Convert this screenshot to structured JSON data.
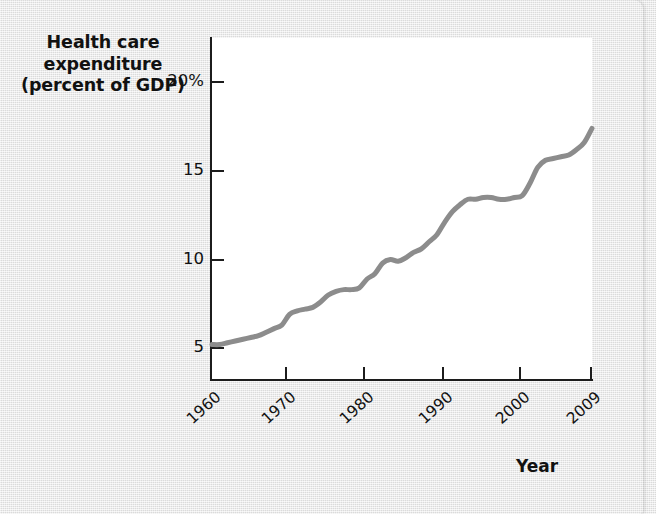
{
  "figure": {
    "background_color": "#e8e8e8",
    "plot_background_color": "#ffffff",
    "axis_color": "#1c1c1c"
  },
  "chart_data": {
    "type": "line",
    "title": "",
    "ylabel": "Health care expenditure (percent of GDP)",
    "ylabel_lines": [
      "Health care",
      "expenditure",
      "(percent of GDP)"
    ],
    "xlabel": "Year",
    "xlim": [
      1960,
      2009
    ],
    "ylim": [
      3.2,
      22.5
    ],
    "grid": false,
    "legend": null,
    "line_color": "#8c8c8c",
    "line_width": 5,
    "yticks": [
      20,
      15,
      10,
      5
    ],
    "ytick_labels": [
      "20%",
      "15",
      "10",
      "5"
    ],
    "xticks": [
      1960,
      1970,
      1980,
      1990,
      2000,
      2009
    ],
    "xtick_labels": [
      "1960",
      "1970",
      "1980",
      "1990",
      "2000",
      "2009"
    ],
    "series": [
      {
        "name": "Health care expenditure (percent of GDP)",
        "x": [
          1960,
          1961,
          1962,
          1963,
          1964,
          1965,
          1966,
          1967,
          1968,
          1969,
          1970,
          1971,
          1972,
          1973,
          1974,
          1975,
          1976,
          1977,
          1978,
          1979,
          1980,
          1981,
          1982,
          1983,
          1984,
          1985,
          1986,
          1987,
          1988,
          1989,
          1990,
          1991,
          1992,
          1993,
          1994,
          1995,
          1996,
          1997,
          1998,
          1999,
          2000,
          2001,
          2002,
          2003,
          2004,
          2005,
          2006,
          2007,
          2008,
          2009
        ],
        "values": [
          5.2,
          5.2,
          5.3,
          5.4,
          5.5,
          5.6,
          5.7,
          5.9,
          6.1,
          6.3,
          6.9,
          7.1,
          7.2,
          7.3,
          7.6,
          8.0,
          8.2,
          8.3,
          8.3,
          8.4,
          8.9,
          9.2,
          9.8,
          10.0,
          9.9,
          10.1,
          10.4,
          10.6,
          11.0,
          11.4,
          12.1,
          12.7,
          13.1,
          13.4,
          13.4,
          13.5,
          13.5,
          13.4,
          13.4,
          13.5,
          13.6,
          14.3,
          15.2,
          15.6,
          15.7,
          15.8,
          15.9,
          16.2,
          16.6,
          17.4
        ]
      }
    ]
  },
  "x_axis_pixels": {
    "tick_positions": [
      211,
      286,
      364,
      443,
      520,
      591
    ]
  }
}
